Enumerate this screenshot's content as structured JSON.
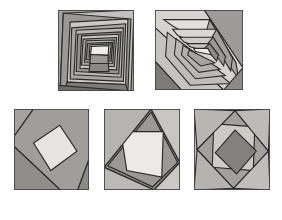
{
  "figure": {
    "background_color": "#ffffff",
    "stroke_color": "#2b2b2b",
    "stroke_width": 0.9,
    "palette": {
      "very_light": "#efeeea",
      "light": "#d8d6d2",
      "light_mid": "#c7c5c1",
      "mid": "#b3b1ad",
      "mid_dark": "#9e9c98",
      "dark": "#8a8884",
      "darker": "#787672",
      "darkest": "#666460",
      "panel_frame": "#4a4a4a"
    },
    "panels": [
      {
        "id": "panel-1",
        "name": "nested-square-spiral-slow",
        "row": "top",
        "column": 1,
        "x": 58,
        "y": 10,
        "width": 76,
        "height": 81,
        "description": "Square with many nested inscribed squares rotating slowly inward, pale quadrilateral at the centre",
        "turns": 6,
        "background_fill": "#b3b1ad",
        "layers": [
          {
            "fill": "#a3a19d",
            "points": "0,0 100,0 100,100 0,100"
          },
          {
            "fill": "#c3c1bd",
            "points": "7,4 100,0 96,100 3,97"
          },
          {
            "fill": "#9b9995",
            "points": "7,4 96,11 92,100 3,97"
          },
          {
            "fill": "#cbc9c5",
            "points": "16,15 92,11 89,92 12,89"
          },
          {
            "fill": "#a8a6a2",
            "points": "18,22 89,17 86,88 16,85"
          },
          {
            "fill": "#bab8b4",
            "points": "24,25 86,22 83,83 21,80"
          },
          {
            "fill": "#969490",
            "points": "26,30 83,27 80,79 24,76"
          },
          {
            "fill": "#c8c6c2",
            "points": "31,32 80,30 77,74 29,72"
          },
          {
            "fill": "#a5a39f",
            "points": "33,36 77,34 74,70 31,68"
          },
          {
            "fill": "#b6b4b0",
            "points": "37,38 74,37 72,66 35,64"
          },
          {
            "fill": "#8e8c88",
            "points": "39,41 72,40 70,63 37,61"
          },
          {
            "fill": "#d2d0cc",
            "points": "42,43 70,42 68,59 41,58"
          },
          {
            "fill": "#efeeea",
            "points": "44,45 67,44 66,56 43,55"
          },
          {
            "fill": "#9a9894",
            "points": "43,55 66,56 66,66 42,66"
          },
          {
            "fill": "#8a8884",
            "points": "42,66 66,66 67,76 41,76"
          },
          {
            "fill": "#7e7c78",
            "points": "12,89 89,92 92,100 8,100"
          },
          {
            "fill": "#6f6d69",
            "points": "0,93 96,100 0,100"
          }
        ]
      },
      {
        "id": "panel-2",
        "name": "nested-triangle-spiral",
        "row": "top",
        "column": 2,
        "x": 155,
        "y": 10,
        "width": 88,
        "height": 80,
        "description": "Square with nested inscribed triangles rotating inward, pale triangle at the centre",
        "turns": 7,
        "background_fill": "#b8b6b2",
        "layers": [
          {
            "fill": "#adaba7",
            "points": "0,0 100,0 100,100 0,100"
          },
          {
            "fill": "#d6d4d0",
            "points": "0,0 56,0 100,72 100,100 78,100 0,22"
          },
          {
            "fill": "#9d9b97",
            "points": "56,0 100,0 100,72"
          },
          {
            "fill": "#c6c4c0",
            "points": "0,22 78,100 30,100 0,64"
          },
          {
            "fill": "#e2e0dc",
            "points": "10,12 62,12 92,66 20,20"
          },
          {
            "fill": "#a9a7a3",
            "points": "62,12 92,66 95,86 58,28"
          },
          {
            "fill": "#bfbdb9",
            "points": "14,28 86,92 40,94 12,58"
          },
          {
            "fill": "#d9d7d3",
            "points": "20,24 70,24 88,60 26,32"
          },
          {
            "fill": "#a4a29e",
            "points": "70,24 88,60 86,76 64,36"
          },
          {
            "fill": "#bab8b4",
            "points": "24,36 80,82 46,86 22,56"
          },
          {
            "fill": "#cecbc7",
            "points": "28,34 66,34 80,58 33,40"
          },
          {
            "fill": "#9a9894",
            "points": "66,34 80,58 78,70 60,42"
          },
          {
            "fill": "#b2b0ac",
            "points": "32,44 74,74 50,78 30,56"
          },
          {
            "fill": "#c9c7c3",
            "points": "36,42 62,42 72,56 40,46"
          },
          {
            "fill": "#8e8c88",
            "points": "62,42 72,56 70,64 57,47"
          },
          {
            "fill": "#a6a4a0",
            "points": "39,50 68,66 52,70 37,56"
          },
          {
            "fill": "#efeeea",
            "points": "44,48 60,48 64,56 46,52"
          },
          {
            "fill": "#7e7c78",
            "points": "0,64 30,100 0,100"
          },
          {
            "fill": "#8d8b87",
            "points": "78,100 100,100 100,72"
          }
        ]
      },
      {
        "id": "panel-3",
        "name": "single-inscribed-quadrilateral",
        "row": "bottom",
        "column": 1,
        "x": 14,
        "y": 109,
        "width": 75,
        "height": 81,
        "description": "Square crossed by two parallel diagonal bands with a pale inscribed quadrilateral at the centre",
        "turns": 1,
        "background_fill": "#999793",
        "layers": [
          {
            "fill": "#999793",
            "points": "0,0 100,0 100,100 0,100"
          },
          {
            "fill": "#a5a39f",
            "points": "0,0 26,0 0,34"
          },
          {
            "fill": "#8f8d89",
            "points": "0,46 62,100 0,100"
          },
          {
            "fill": "#a09e9a",
            "points": "26,0 100,0 100,62 85,100 62,100 0,46 0,34"
          },
          {
            "fill": "#e7e5e1",
            "points": "26,42 61,20 84,52 49,76"
          },
          {
            "fill": "#8d8b87",
            "points": "100,62 100,100 85,100"
          }
        ]
      },
      {
        "id": "panel-4",
        "name": "two-step-inscribed-quadrilateral",
        "row": "bottom",
        "column": 2,
        "x": 104,
        "y": 109,
        "width": 76,
        "height": 81,
        "description": "Square with a rotated inner square and a second pale quadrilateral inscribed inside it",
        "turns": 2,
        "background_fill": "#c2c0bc",
        "layers": [
          {
            "fill": "#c2c0bc",
            "points": "0,0 100,0 100,100 0,100"
          },
          {
            "fill": "#918f8b",
            "points": "62,0 100,66 66,100 0,72"
          },
          {
            "fill": "#a7a5a1",
            "points": "62,0 100,66 66,100 0,72"
          },
          {
            "fill": "#8a8884",
            "points": "62,0 100,66 66,100 0,72"
          },
          {
            "fill": "#9b9995",
            "points": "62,4 97,66 64,96 5,70"
          },
          {
            "fill": "#eceae6",
            "points": "22,28 78,28 76,84 30,76"
          },
          {
            "fill": "#b6b4b0",
            "points": "0,0 62,0 0,72"
          },
          {
            "fill": "#c8c6c2",
            "points": "100,0 100,66 62,0"
          },
          {
            "fill": "#bcbab6",
            "points": "0,72 66,100 0,100"
          },
          {
            "fill": "#cbc9c5",
            "points": "66,100 100,66 100,100"
          }
        ]
      },
      {
        "id": "panel-5",
        "name": "three-step-inscribed-square",
        "row": "bottom",
        "column": 3,
        "x": 194,
        "y": 109,
        "width": 76,
        "height": 81,
        "description": "Square with a rotated diamond, an axis-aligned square and a dark rotated square nested inside",
        "turns": 3,
        "background_fill": "#c5c3bf",
        "layers": [
          {
            "fill": "#c5c3bf",
            "points": "0,0 100,0 100,100 0,100"
          },
          {
            "fill": "#a3a19d",
            "points": "54,2 98,52 52,98 4,50"
          },
          {
            "fill": "#cecbc7",
            "points": "26,18 80,22 78,76 24,72"
          },
          {
            "fill": "#83817d",
            "points": "54,26 82,52 56,80 28,54"
          },
          {
            "fill": "#b8b6b2",
            "points": "0,0 54,2 4,50"
          },
          {
            "fill": "#bdbbb7",
            "points": "100,0 98,52 54,2"
          },
          {
            "fill": "#b5b3af",
            "points": "4,50 52,98 0,100"
          },
          {
            "fill": "#c0bebA",
            "points": "52,98 98,52 100,100"
          }
        ]
      }
    ]
  }
}
